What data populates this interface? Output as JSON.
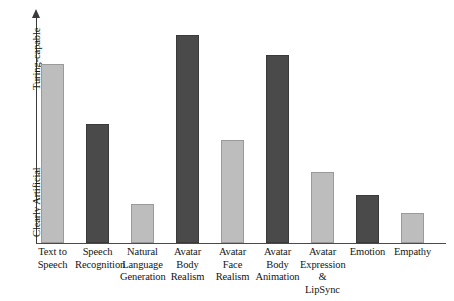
{
  "chart_data": {
    "type": "bar",
    "title": "",
    "subtitle": "",
    "xlabel": "",
    "ylabel": "",
    "grid": false,
    "legend": "none",
    "y_axis": {
      "top_label": "Turing-capable",
      "bottom_label": "Clearly Artificial",
      "has_arrow": true,
      "ylim": [
        0,
        100
      ],
      "tick_labels": []
    },
    "categories": [
      "Text to Speech",
      "Speech Recognition",
      "Natural Language Generation",
      "Avatar Body Realism",
      "Avatar Face Realism",
      "Avatar Body Animation",
      "Avatar Expression & LipSync",
      "Emotion",
      "Empathy"
    ],
    "category_label_lines": [
      [
        "Text to",
        "Speech"
      ],
      [
        "Speech",
        "Recognition"
      ],
      [
        "Natural",
        "Language",
        "Generation"
      ],
      [
        "Avatar",
        "Body",
        "Realism"
      ],
      [
        "Avatar",
        "Face",
        "Realism"
      ],
      [
        "Avatar",
        "Body",
        "Animation"
      ],
      [
        "Avatar",
        "Expression",
        "& LipSync"
      ],
      [
        "Emotion"
      ],
      [
        "Empathy"
      ]
    ],
    "values": [
      78,
      52,
      17,
      91,
      45,
      82,
      31,
      21,
      13
    ],
    "bar_colors": [
      "#bdbdbd",
      "#4a4a4a",
      "#bdbdbd",
      "#4a4a4a",
      "#bdbdbd",
      "#4a4a4a",
      "#bdbdbd",
      "#4a4a4a",
      "#bdbdbd"
    ],
    "bar_shades": [
      "light",
      "dark",
      "light",
      "dark",
      "light",
      "dark",
      "light",
      "dark",
      "light"
    ],
    "colors": {
      "light_bar": "#bdbdbd",
      "dark_bar": "#4a4a4a",
      "axis": "#3b3b3b",
      "background": "#ffffff",
      "text": "#141414"
    },
    "layout": {
      "bar_width_px": 23,
      "bar_pitch_px": 45,
      "first_bar_left_px": 5,
      "plot_height_px": 229,
      "baseline_y_px": 243
    }
  }
}
